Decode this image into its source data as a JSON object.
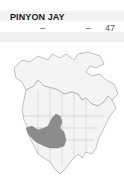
{
  "species": {
    "title": "PINYON JAY",
    "values": [
      "–",
      "–",
      "47"
    ]
  },
  "map": {
    "region": "North America",
    "range_color": "#8c8c8c",
    "land_color": "#f4f4f4",
    "border_color": "#9a9a9a"
  }
}
